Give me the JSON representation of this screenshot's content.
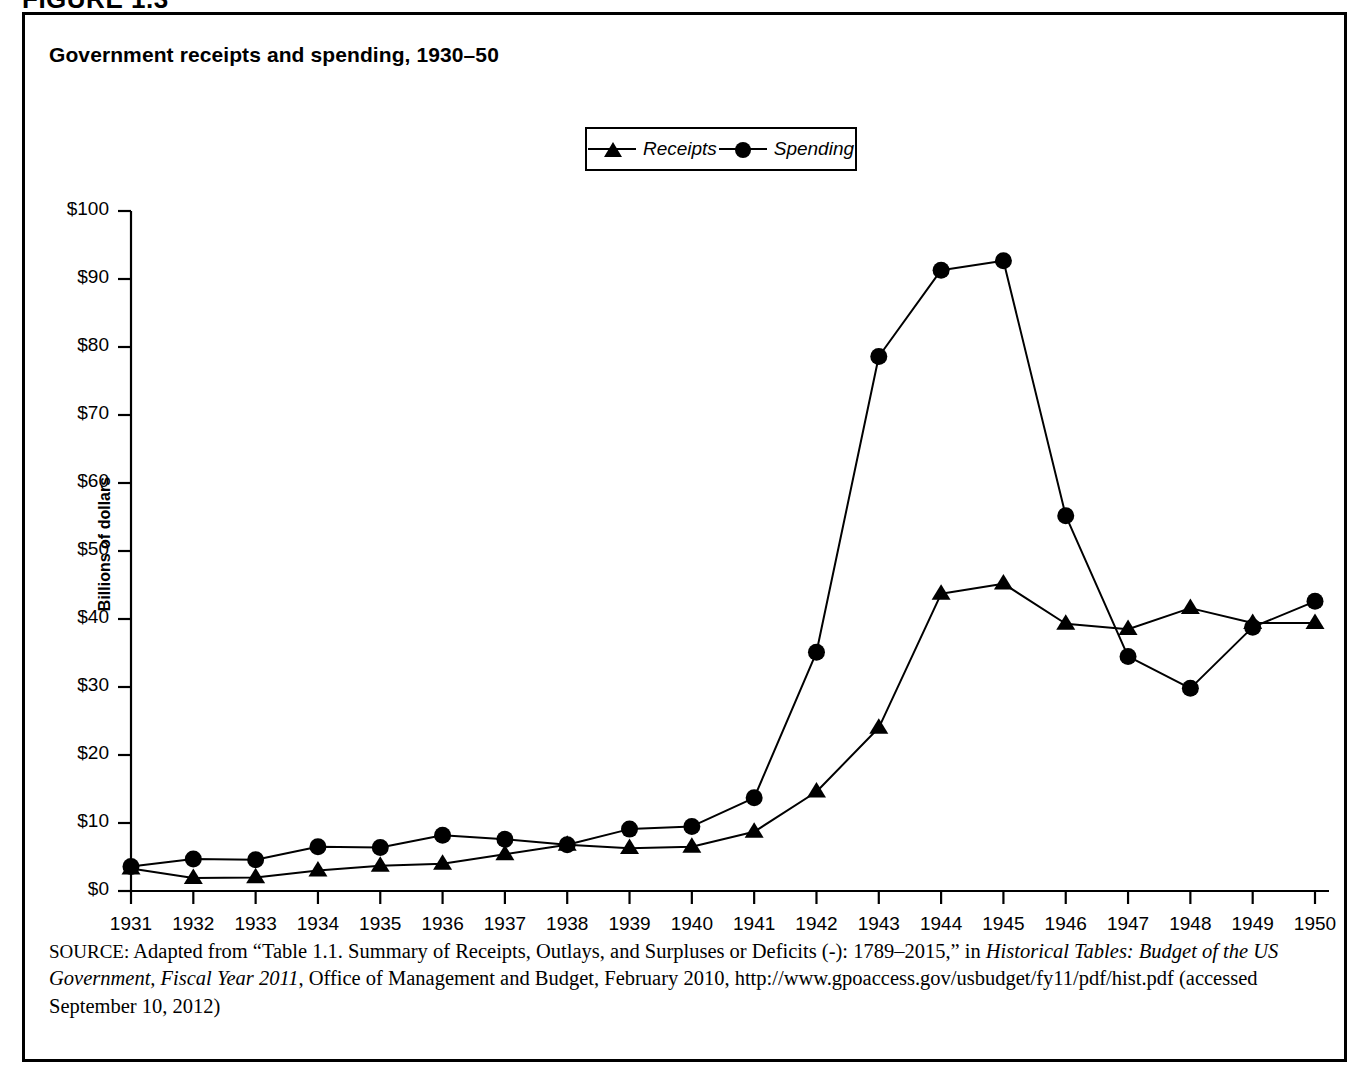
{
  "figure": {
    "number_label": "FIGURE 1.3",
    "title": "Government receipts and spending, 1930–50"
  },
  "legend": {
    "items": [
      {
        "label": "Receipts",
        "marker": "triangle-marker-icon"
      },
      {
        "label": "Spending",
        "marker": "circle-marker-icon"
      }
    ]
  },
  "axes": {
    "y_title": "Billions of dollars",
    "y_ticks": [
      "$100",
      "$90",
      "$80",
      "$70",
      "$60",
      "$50",
      "$40",
      "$30",
      "$20",
      "$10",
      "$0"
    ],
    "x_ticks": [
      "1931",
      "1932",
      "1933",
      "1934",
      "1935",
      "1936",
      "1937",
      "1938",
      "1939",
      "1940",
      "1941",
      "1942",
      "1943",
      "1944",
      "1945",
      "1946",
      "1947",
      "1948",
      "1949",
      "1950"
    ]
  },
  "source": {
    "prefix": "SOURCE:",
    "line_1a": " Adapted from “Table 1.1. Summary of Receipts, Outlays, and Surpluses or Deficits (-): 1789–2015,” in ",
    "italic_1": "Historical Tables: Budget of the US Government, Fiscal Year 2011",
    "line_1b": ", Office of Management and Budget, February 2010, http://www.gpoaccess.gov/usbudget/fy11/pdf/hist.pdf (accessed September 10, 2012)"
  },
  "colors": {
    "ink": "#000000",
    "background": "#ffffff"
  },
  "chart_data": {
    "type": "line",
    "title": "Government receipts and spending, 1930–50",
    "xlabel": "",
    "ylabel": "Billions of dollars",
    "ylim": [
      0,
      100
    ],
    "ytick_step": 10,
    "grid": false,
    "legend_position": "top-center",
    "x": [
      1931,
      1932,
      1933,
      1934,
      1935,
      1936,
      1937,
      1938,
      1939,
      1940,
      1941,
      1942,
      1943,
      1944,
      1945,
      1946,
      1947,
      1948,
      1949,
      1950
    ],
    "series": [
      {
        "name": "Receipts",
        "marker": "triangle",
        "values": [
          3.3,
          1.9,
          2.0,
          3.0,
          3.7,
          4.0,
          5.4,
          6.8,
          6.3,
          6.5,
          8.7,
          14.6,
          24.0,
          43.7,
          45.2,
          39.3,
          38.5,
          41.6,
          39.4,
          39.4
        ]
      },
      {
        "name": "Spending",
        "marker": "circle",
        "values": [
          3.6,
          4.7,
          4.6,
          6.5,
          6.4,
          8.2,
          7.6,
          6.8,
          9.1,
          9.5,
          13.7,
          35.1,
          78.6,
          91.3,
          92.7,
          55.2,
          34.5,
          29.8,
          38.8,
          42.6
        ]
      }
    ]
  }
}
